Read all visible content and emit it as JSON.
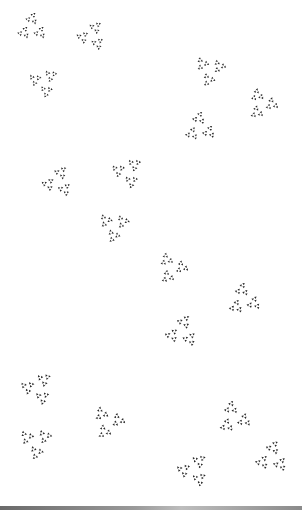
{
  "image": {
    "description": "Fractal pattern of Sierpinski-like triangular clusters on white background",
    "background": "#ffffff",
    "ink": "#2a2a2a",
    "clusters": [
      {
        "x": 32,
        "y": 28,
        "s": 34
      },
      {
        "x": 92,
        "y": 36,
        "s": 34
      },
      {
        "x": 44,
        "y": 82,
        "s": 34
      },
      {
        "x": 210,
        "y": 70,
        "s": 36
      },
      {
        "x": 262,
        "y": 104,
        "s": 36
      },
      {
        "x": 200,
        "y": 128,
        "s": 36
      },
      {
        "x": 58,
        "y": 182,
        "s": 36
      },
      {
        "x": 128,
        "y": 172,
        "s": 36
      },
      {
        "x": 114,
        "y": 226,
        "s": 36
      },
      {
        "x": 172,
        "y": 268,
        "s": 36
      },
      {
        "x": 244,
        "y": 300,
        "s": 38
      },
      {
        "x": 182,
        "y": 332,
        "s": 38
      },
      {
        "x": 38,
        "y": 388,
        "s": 38
      },
      {
        "x": 36,
        "y": 442,
        "s": 38
      },
      {
        "x": 108,
        "y": 422,
        "s": 38
      },
      {
        "x": 234,
        "y": 418,
        "s": 38
      },
      {
        "x": 272,
        "y": 458,
        "s": 38
      },
      {
        "x": 194,
        "y": 470,
        "s": 38
      }
    ]
  }
}
